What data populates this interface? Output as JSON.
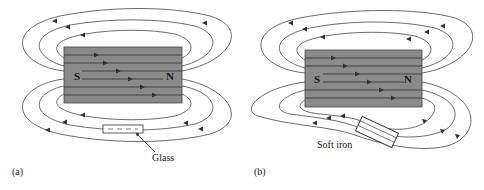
{
  "figure": {
    "panels": [
      {
        "id": "a",
        "caption": "(a)",
        "magnet": {
          "south_label": "S",
          "north_label": "N",
          "color": "#8a8a8a"
        },
        "object_label": "Glass",
        "object_type": "glass-slab"
      },
      {
        "id": "b",
        "caption": "(b)",
        "magnet": {
          "south_label": "S",
          "north_label": "N",
          "color": "#8a8a8a"
        },
        "object_label": "Soft iron",
        "object_type": "soft-iron-bar"
      }
    ]
  }
}
